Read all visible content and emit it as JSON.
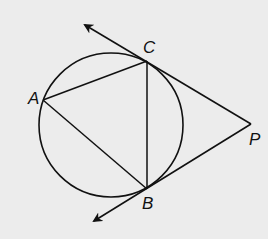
{
  "diagram": {
    "background": "#ececec",
    "stroke": "#111111",
    "circle": {
      "cx": 111,
      "cy": 125,
      "r": 72
    },
    "points": {
      "A": {
        "label": "A",
        "x": 43,
        "y": 100,
        "lx": 28,
        "ly": 104
      },
      "B": {
        "label": "B",
        "x": 147,
        "y": 189,
        "lx": 142,
        "ly": 209
      },
      "C": {
        "label": "C",
        "x": 147,
        "y": 61,
        "lx": 143,
        "ly": 53
      },
      "P": {
        "label": "P",
        "x": 251,
        "y": 124,
        "lx": 249,
        "ly": 145
      }
    },
    "segments": [
      "AC",
      "AB",
      "CB",
      "CP",
      "BP"
    ],
    "rays": [
      {
        "from": "P",
        "through": "C",
        "tip": {
          "x": 83,
          "y": 24
        }
      },
      {
        "from": "P",
        "through": "B",
        "tip": {
          "x": 92,
          "y": 222
        }
      }
    ]
  }
}
